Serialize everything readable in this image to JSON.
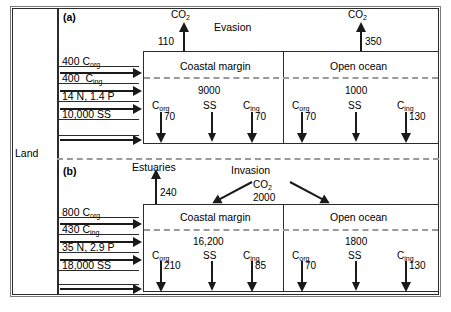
{
  "figure": {
    "land_label": "Land",
    "panels": [
      {
        "id": "a",
        "label": "(a)",
        "atmos_process": "Evasion",
        "atmos_fluxes": [
          {
            "species": "CO",
            "species_sub": "2",
            "value": "110",
            "direction": "up",
            "target": "coastal-margin"
          },
          {
            "species": "CO",
            "species_sub": "2",
            "value": "350",
            "direction": "up",
            "target": "open-ocean"
          }
        ],
        "land_inputs": [
          {
            "value": "400",
            "species": "C",
            "species_sub": "org",
            "text": "400 Corg"
          },
          {
            "value": "400",
            "species": "C",
            "species_sub": "ing",
            "text": "400  Cing"
          },
          {
            "value": "14",
            "species": "N, 1.4 P",
            "species_sub": "",
            "text": "14 N, 1.4 P"
          },
          {
            "value": "10,000",
            "species": "SS",
            "species_sub": "",
            "text": "10,000 SS"
          }
        ],
        "reservoirs": [
          {
            "name": "Coastal margin",
            "pool_value": "9000",
            "pool_label": "SS",
            "burial": [
              {
                "label": "C",
                "label_sub": "org",
                "value": "70"
              },
              {
                "label": "SS",
                "label_sub": "",
                "value": ""
              },
              {
                "label": "C",
                "label_sub": "ing",
                "value": "70"
              }
            ]
          },
          {
            "name": "Open ocean",
            "pool_value": "1000",
            "pool_label": "SS",
            "burial": [
              {
                "label": "C",
                "label_sub": "org",
                "value": "70"
              },
              {
                "label": "SS",
                "label_sub": "",
                "value": ""
              },
              {
                "label": "C",
                "label_sub": "ing",
                "value": "130"
              }
            ]
          }
        ]
      },
      {
        "id": "b",
        "label": "(b)",
        "estuaries_label": "Estuaries",
        "estuaries_value": "240",
        "atmos_process": "Invasion",
        "invasion_species": "CO",
        "invasion_species_sub": "2",
        "invasion_value": "2000",
        "land_inputs": [
          {
            "value": "800",
            "species": "C",
            "species_sub": "org",
            "text": "800 Corg"
          },
          {
            "value": "430",
            "species": "C",
            "species_sub": "ing",
            "text": "430 Cing"
          },
          {
            "value": "35",
            "species": "N, 2.9 P",
            "species_sub": "",
            "text": "35 N, 2.9 P"
          },
          {
            "value": "18,000",
            "species": "SS",
            "species_sub": "",
            "text": "18,000 SS"
          }
        ],
        "reservoirs": [
          {
            "name": "Coastal margin",
            "pool_value": "16,200",
            "pool_label": "SS",
            "burial": [
              {
                "label": "C",
                "label_sub": "org",
                "value": "210"
              },
              {
                "label": "SS",
                "label_sub": "",
                "value": ""
              },
              {
                "label": "C",
                "label_sub": "ing",
                "value": "85"
              }
            ]
          },
          {
            "name": "Open ocean",
            "pool_value": "1800",
            "pool_label": "SS",
            "burial": [
              {
                "label": "C",
                "label_sub": "org",
                "value": "70"
              },
              {
                "label": "SS",
                "label_sub": "",
                "value": ""
              },
              {
                "label": "C",
                "label_sub": "ing",
                "value": "130"
              }
            ]
          }
        ]
      }
    ]
  },
  "colors": {
    "ink": "#1a1a1a",
    "frame": "#2b2b2b",
    "dashed": "#9a9a9a",
    "outer": "#7a7a7a",
    "background": "#ffffff"
  }
}
